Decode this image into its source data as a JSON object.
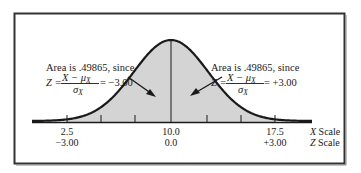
{
  "figure": {
    "left_annotation": {
      "line1": "Area is .49865, since",
      "z_label": "Z =",
      "numerator": "X − μ",
      "numerator_sub": "X",
      "denominator": "σ",
      "denominator_sub": "X",
      "result": "= −3.00"
    },
    "right_annotation": {
      "line1": "Area is .49865, since",
      "z_label": "Z =",
      "numerator": "X − μ",
      "numerator_sub": "X",
      "denominator": "σ",
      "denominator_sub": "X",
      "result": "= +3.00"
    },
    "x_scale": {
      "name_var": "X",
      "name_word": " Scale",
      "ticks": [
        "2.5",
        "10.0",
        "17.5"
      ]
    },
    "z_scale": {
      "name_var": "Z",
      "name_word": " Scale",
      "ticks": [
        "−3.00",
        "0.0",
        "+3.00"
      ]
    },
    "colors": {
      "shade": "#d4d4d4",
      "curve": "#1a1a1a",
      "frame": "#333333"
    }
  },
  "chart_data": {
    "type": "area",
    "distribution": "normal",
    "mean_x": 10.0,
    "sd_x": 2.5,
    "shaded_range_x": [
      2.5,
      17.5
    ],
    "shaded_range_z": [
      -3.0,
      3.0
    ],
    "x_ticks": [
      2.5,
      10.0,
      17.5
    ],
    "z_ticks": [
      -3.0,
      0.0,
      3.0
    ],
    "annotations": [
      {
        "side": "left",
        "text": "Area is .49865, since Z = (X − μX)/σX = −3.00",
        "area": 0.49865
      },
      {
        "side": "right",
        "text": "Area is .49865, since Z = (X − μX)/σX = +3.00",
        "area": 0.49865
      }
    ],
    "xlabel": "X Scale",
    "zlabel": "Z Scale",
    "grid": false
  }
}
